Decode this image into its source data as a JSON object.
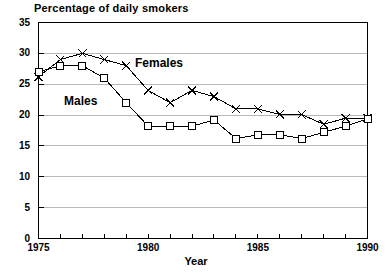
{
  "chart": {
    "title": "Percentage of daily smokers",
    "xlabel": "Year",
    "series_labels": {
      "females": "Females",
      "males": "Males"
    }
  },
  "chart_data": {
    "type": "line",
    "title": "Percentage of daily smokers",
    "subtitle": "",
    "xlabel": "Year",
    "ylabel": "",
    "x": [
      1975,
      1976,
      1977,
      1978,
      1979,
      1980,
      1981,
      1982,
      1983,
      1984,
      1985,
      1986,
      1987,
      1988,
      1989,
      1990
    ],
    "xlim": [
      1975,
      1990
    ],
    "ylim": [
      0,
      35
    ],
    "xticks": [
      1975,
      1976,
      1977,
      1978,
      1979,
      1980,
      1981,
      1982,
      1983,
      1984,
      1985,
      1986,
      1987,
      1988,
      1989,
      1990
    ],
    "xtick_labels": [
      "1975",
      "",
      "",
      "",
      "",
      "1980",
      "",
      "",
      "",
      "",
      "1985",
      "",
      "",
      "",
      "",
      "1990"
    ],
    "yticks": [
      0,
      5,
      10,
      15,
      20,
      25,
      30,
      35
    ],
    "ytick_labels": [
      "0",
      "5",
      "10",
      "15",
      "20",
      "25",
      "30",
      "35"
    ],
    "grid": true,
    "grid_axis": "y",
    "legend": "inline-annotations",
    "legend_position": "in-plot",
    "series": [
      {
        "name": "Females",
        "marker": "x",
        "color": "#000000",
        "values": [
          26.2,
          29.0,
          30.0,
          29.0,
          28.0,
          24.0,
          22.0,
          24.0,
          23.0,
          21.0,
          21.0,
          20.1,
          20.1,
          18.5,
          19.5,
          19.5
        ]
      },
      {
        "name": "Males",
        "marker": "square",
        "color": "#000000",
        "values": [
          27.0,
          28.0,
          28.0,
          26.0,
          22.0,
          18.2,
          18.2,
          18.2,
          19.2,
          16.2,
          16.8,
          16.8,
          16.2,
          17.2,
          18.2,
          19.4
        ]
      }
    ],
    "annotations": [
      {
        "text": "Females",
        "x": 1981.3,
        "y": 26.5
      },
      {
        "text": "Males",
        "x": 1977.2,
        "y": 22.6
      }
    ]
  }
}
